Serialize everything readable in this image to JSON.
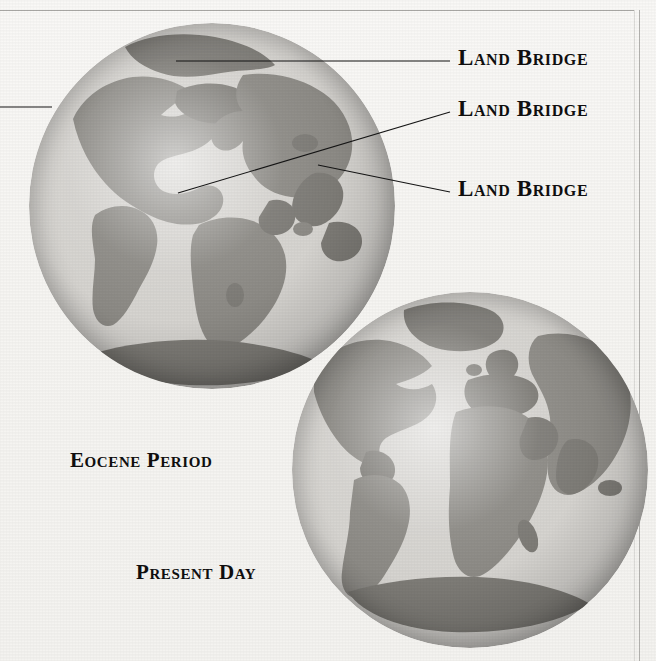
{
  "figure": {
    "background_color": "#f7f6f4",
    "ocean_color": "#d6d4d0",
    "land_color": "#8d8b86",
    "line_color": "#151515",
    "text_color": "#100f0f"
  },
  "annotations": {
    "land_bridge_1": "Land Bridge",
    "land_bridge_2": "Land Bridge",
    "land_bridge_3": "Land Bridge"
  },
  "captions": {
    "eocene": "Eocene Period",
    "present": "Present Day"
  },
  "globes": [
    {
      "id": "eocene-globe",
      "caption": "Eocene Period",
      "center_x": 212,
      "center_y": 206,
      "radius": 183
    },
    {
      "id": "present-day-globe",
      "caption": "Present Day",
      "center_x": 470,
      "center_y": 470,
      "radius": 178
    }
  ],
  "leader_lines": [
    {
      "name": "leader-land-bridge-1",
      "x1": 176,
      "y1": 61,
      "x2": 450,
      "y2": 61
    },
    {
      "name": "leader-land-bridge-2",
      "x1": 178,
      "y1": 193,
      "x2": 450,
      "y2": 112
    },
    {
      "name": "leader-land-bridge-3",
      "x1": 318,
      "y1": 165,
      "x2": 450,
      "y2": 192
    },
    {
      "name": "leader-edge-left",
      "x1": 0,
      "y1": 107,
      "x2": 52,
      "y2": 107
    }
  ]
}
